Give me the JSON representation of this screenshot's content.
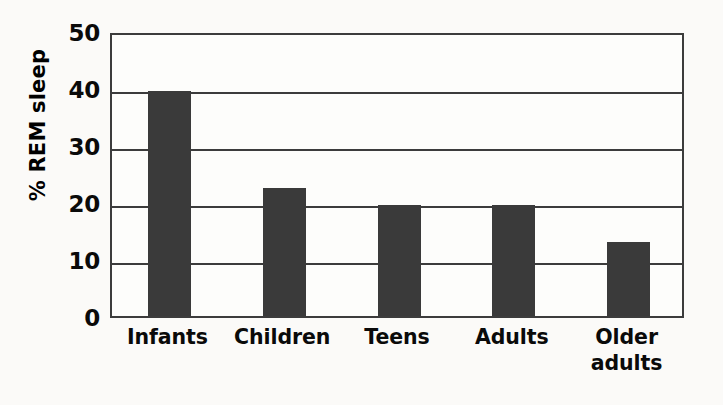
{
  "chart_data": {
    "type": "bar",
    "title": "",
    "xlabel": "",
    "ylabel": "% REM sleep",
    "ylim": [
      0,
      50
    ],
    "yticks": [
      0,
      10,
      20,
      30,
      40,
      50
    ],
    "ytick_labels": [
      "0",
      "10",
      "20",
      "30",
      "40",
      "50"
    ],
    "grid": true,
    "legend": "none",
    "categories": [
      "Infants",
      "Children",
      "Teens",
      "Adults",
      "Older adults"
    ],
    "category_lines": [
      [
        "Infants"
      ],
      [
        "Children"
      ],
      [
        "Teens"
      ],
      [
        "Adults"
      ],
      [
        "Older",
        "adults"
      ]
    ],
    "values": [
      39.5,
      22.5,
      19.5,
      19.5,
      13
    ],
    "series": [
      {
        "name": "% REM sleep",
        "values": [
          39.5,
          22.5,
          19.5,
          19.5,
          13
        ]
      }
    ],
    "bar_color": "#3a3a3a",
    "axis_color": "#3c3c3c",
    "background_color": "#fbfaf8"
  }
}
